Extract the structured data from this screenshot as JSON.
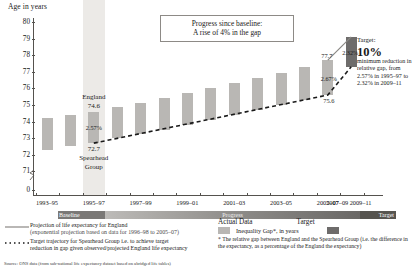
{
  "axis_title": "Age in years",
  "callout": {
    "line1": "Progress since baseline:",
    "line2": "A rise of 4% in the gap"
  },
  "target_note": {
    "head": "Target:",
    "big": "10%",
    "body": "minimum reduction in relative gap, from 2.57% in 1995–97 to 2.32% in 2009–11"
  },
  "phases": {
    "baseline": "Baseline",
    "progress": "Progress",
    "target": "Target"
  },
  "annotations": {
    "england_label": "England",
    "england_value": "74.6",
    "spearhead_value": "72.7",
    "spearhead_label_line1": "Spearhead",
    "spearhead_label_line2": "Group",
    "baseline_gap": "2.57%",
    "y2005_top": "77.7",
    "y2005_bottom": "75.6",
    "y2005_gap": "2.67%",
    "target_gap": "2.32%"
  },
  "legend": {
    "series1_line1": "Projection of life expectancy for England",
    "series1_line2": "(exponential projection based on data for 1996–98 to 2005–07)",
    "series2_line1": "Target trajectory for Spearhead Group i.e. to achieve target",
    "series2_line2": "reduction in gap given observed/projected England life expectancy",
    "actual_data": "Actual Data",
    "target": "Target",
    "swatch_label": "Inequality Gap*, in years",
    "footnote": "* The relative gap between England and the Spearhead Group (i.e. the difference in the expectancy, as a percentage of the England the expectancy)",
    "source": "Source: ONS data (from sub-national life expectancy dataset based on abridged life tables)"
  },
  "colors": {
    "bar": "#b9b7b4",
    "bar_target": "#6e6c6b",
    "axis": "#55524e",
    "highlight": "#eceae7"
  },
  "chart_data": {
    "type": "bar",
    "xlabel": "",
    "ylabel": "Age in years",
    "ylim": [
      70.5,
      80
    ],
    "grid": false,
    "legend_position": "bottom",
    "axis_break": true,
    "y_ticks": [
      "0",
      "71",
      "72",
      "73",
      "74",
      "75",
      "76",
      "77",
      "78",
      "79",
      "80"
    ],
    "x_tick_labels": [
      "1993–95",
      "1995–97",
      "1997–99",
      "1999–01",
      "2001–03",
      "2003–05",
      "2005–07",
      "2007–09",
      "2009–11"
    ],
    "categories": [
      "1993–95",
      "1994–96",
      "1995–97",
      "1996–98",
      "1997–99",
      "1998–00",
      "1999–01",
      "2000–02",
      "2001–03",
      "2002–04",
      "2003–05",
      "2004–06",
      "2005–07",
      "2009–11"
    ],
    "series": [
      {
        "name": "England life expectancy (bar top)",
        "values": [
          74.2,
          74.4,
          74.6,
          74.85,
          75.1,
          75.4,
          75.7,
          76.0,
          76.3,
          76.6,
          76.9,
          77.3,
          77.7,
          79.1
        ]
      },
      {
        "name": "Spearhead Group life expectancy (bar bottom)",
        "values": [
          72.3,
          72.5,
          72.7,
          73.0,
          73.25,
          73.5,
          73.8,
          74.1,
          74.4,
          74.7,
          75.0,
          75.3,
          75.6,
          77.3
        ]
      },
      {
        "name": "Inequality gap (%)",
        "values": [
          null,
          null,
          2.57,
          null,
          null,
          null,
          null,
          null,
          null,
          null,
          null,
          null,
          2.67,
          2.32
        ]
      }
    ],
    "lines": [
      {
        "name": "Projection of life expectancy for England",
        "style": "solid",
        "points": [
          [
            12,
            77.7
          ],
          [
            13,
            79.1
          ]
        ]
      },
      {
        "name": "Target trajectory for Spearhead Group",
        "style": "dashed",
        "points": [
          [
            2,
            72.7
          ],
          [
            12,
            75.6
          ],
          [
            13,
            77.3
          ]
        ]
      }
    ]
  }
}
